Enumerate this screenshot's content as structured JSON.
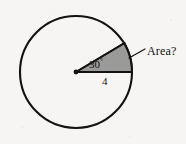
{
  "figure": {
    "kind": "circle-sector-area-diagram",
    "background_color": "#f6f5f3",
    "stroke_color": "#14120f",
    "sector_fill_color": "#9a9a98",
    "circle": {
      "center_x": 76,
      "center_y": 72,
      "radius": 56,
      "stroke_width": 2
    },
    "sector": {
      "radius_label": "4",
      "angle_label": "30",
      "degree_symbol": "°",
      "start_angle_deg": 0,
      "sweep_angle_deg": 30,
      "filled": true
    },
    "callout": {
      "label": "Area?",
      "leader_from_x": 129,
      "leader_from_y": 58,
      "leader_to_x": 145,
      "leader_to_y": 49
    },
    "center_dot": {
      "x": 76,
      "y": 72,
      "r": 2.4
    }
  }
}
